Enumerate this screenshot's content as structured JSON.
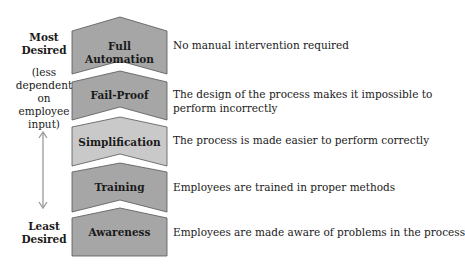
{
  "side_labels": {
    "top": [
      "Most",
      "Desired"
    ],
    "top_note": [
      "(less",
      "dependent",
      "on employee",
      "input)"
    ],
    "bottom": [
      "Least",
      "Desired"
    ]
  },
  "levels": [
    {
      "label": "Full Automation",
      "description": [
        "No manual intervention required"
      ],
      "fill": "#a6a6a6"
    },
    {
      "label": "Fail-Proof",
      "description": [
        "The design of the process makes it impossible to",
        "perform incorrectly"
      ],
      "fill": "#a6a6a6"
    },
    {
      "label": "Simplification",
      "description": [
        "The process is made easier to perform correctly"
      ],
      "fill": "#c9c9c9"
    },
    {
      "label": "Training",
      "description": [
        "Employees are trained in proper methods"
      ],
      "fill": "#a6a6a6"
    },
    {
      "label": "Awareness",
      "description": [
        "Employees are made aware of problems in the process"
      ],
      "fill": "#a6a6a6"
    }
  ],
  "colors": {
    "stroke": "#555555",
    "arrow": "#9a9a9a"
  }
}
